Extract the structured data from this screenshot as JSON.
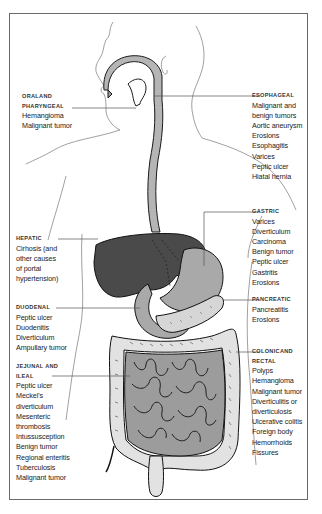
{
  "diagram": {
    "colors": {
      "liver": "#4a4a4a",
      "stomach": "#a9a9a9",
      "esophagus": "#b5b5b5",
      "small_intestine": "#9c9c9c",
      "colon": "#e2e2e2",
      "pancreas": "#d6d6d6",
      "outline": "#1a1a1a",
      "leader_line": "#555555"
    },
    "regions": {
      "oral_pharyngeal": {
        "heading_line1": "ORALAND",
        "heading_line2": "PHARYNGEAL",
        "items": [
          "Hemangioma",
          "Malignant tumor"
        ]
      },
      "esophageal": {
        "heading": "ESOPHAGEAL",
        "items": [
          "Malignant and",
          "benign tumors",
          "Aortic aneurysm",
          "Erosions",
          "Esophagitis",
          "Varices",
          "Peptic ulcer",
          "Hiatal hernia"
        ]
      },
      "hepatic": {
        "heading": "HEPATIC",
        "items": [
          "Cirhosis (and",
          "other causes",
          "of portal",
          "hypertension)"
        ]
      },
      "gastric": {
        "heading": "GASTRIC",
        "items": [
          "Varices",
          "Diverticulum",
          "Carcinoma",
          "Benign tumor",
          "Peptic ulcer",
          "Gastritis",
          "Erosions"
        ]
      },
      "duodenal": {
        "heading": "DUODENAL",
        "items": [
          "Peptic ulcer",
          "Duodenitis",
          "Diverticulum",
          "Ampullary tumor"
        ]
      },
      "pancreatic": {
        "heading": "PANCREATIC",
        "items": [
          "Pancreatitis",
          "Erosions"
        ]
      },
      "jejunal_ileal": {
        "heading_line1": "JEJUNAL AND",
        "heading_line2": "ILEAL",
        "items": [
          "Peptic ulcer",
          "Meckel's",
          "diverticulum",
          "Mesenteric",
          "thrombosis",
          "Intussusception",
          "Benign tumor",
          "Regional enteritis",
          "Tuberculosis",
          "Malignant tumor"
        ]
      },
      "colonic_rectal": {
        "heading_line1": "COLONICAND",
        "heading_line2": "RECTAL",
        "items": [
          "Polyps",
          "Hemangioma",
          "Malignant tumor",
          "Diverticulitis or",
          "diverticulosis",
          "Ulcerative colitis",
          "Foreign body",
          "Hemorrhoids",
          "Fissures"
        ]
      }
    }
  }
}
